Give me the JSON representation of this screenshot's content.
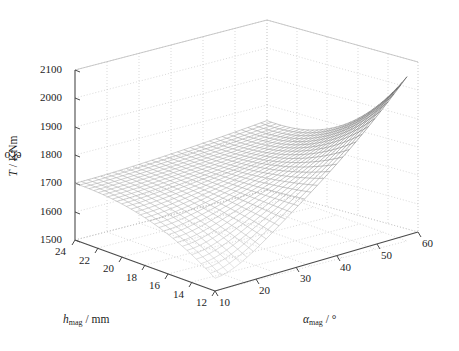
{
  "figure": {
    "background": "#ffffff",
    "mesh_color": "#8f8f8f",
    "axis_color": "#4a4a4a",
    "grid_color": "#c8c8c8"
  },
  "chart_data": {
    "type": "surface",
    "title": "",
    "xlabel": "h_mag / mm",
    "ylabel": "α_mag / °",
    "zlabel": "T_el,o / KNm",
    "xlabel_html": "<i>h</i><span class=\"sub\">mag</span> / mm",
    "ylabel_html": "<i>α</i><span class=\"sub\">mag</span> / °",
    "zlabel_html": "<i>T</i><span class=\"sub\">el,o</span> / KNm",
    "xticks": [
      24,
      22,
      20,
      18,
      16,
      14,
      12
    ],
    "yticks": [
      10,
      20,
      30,
      40,
      50,
      60
    ],
    "zticks": [
      1500,
      1600,
      1700,
      1800,
      1900,
      2000,
      2100
    ],
    "xlim": [
      12,
      24
    ],
    "ylim": [
      10,
      60
    ],
    "zlim": [
      1500,
      2100
    ],
    "grid": true,
    "legend": false,
    "mesh_nx": 31,
    "mesh_ny": 31,
    "z_corners": {
      "h12_a10": 1600,
      "h12_a60": 2080,
      "h24_a10": 1700,
      "h24_a60": 1745
    },
    "z_min": 1560,
    "z_max": 2085
  },
  "ticklabels": {
    "z": [
      "2100",
      "2000",
      "1900",
      "1800",
      "1700",
      "1600",
      "1500"
    ],
    "x": [
      "24",
      "22",
      "20",
      "18",
      "16",
      "14",
      "12"
    ],
    "y": [
      "10",
      "20",
      "30",
      "40",
      "50",
      "60"
    ]
  }
}
